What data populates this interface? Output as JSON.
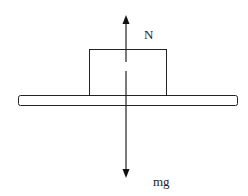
{
  "diagram": {
    "labels": {
      "normal_force": "N",
      "weight": "mg"
    },
    "colors": {
      "stroke": "#222222",
      "background": "#ffffff"
    }
  }
}
